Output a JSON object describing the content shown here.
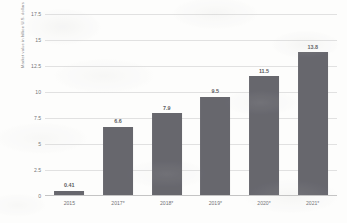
{
  "chart_data": {
    "type": "bar",
    "title": "",
    "xlabel": "",
    "ylabel": "Market value in billion U.S. dollars",
    "categories": [
      "2015",
      "2017*",
      "2018*",
      "2019*",
      "2020*",
      "2021*"
    ],
    "values": [
      0.41,
      6.6,
      7.9,
      9.5,
      11.5,
      13.8
    ],
    "value_labels": [
      "0.41",
      "6.6",
      "7.9",
      "9.5",
      "11.5",
      "13.8"
    ],
    "ylim": [
      0,
      17.5
    ],
    "y_ticks": [
      0,
      2.5,
      5,
      7.5,
      10,
      12.5,
      15,
      17.5
    ],
    "y_tick_labels": [
      "0",
      "2.5",
      "5",
      "7.5",
      "10",
      "12.5",
      "15",
      "17.5"
    ],
    "grid": true,
    "legend": false,
    "bar_color": "#4a4a52",
    "gridline_color": "#dcdcdc",
    "background_color": "#fdfdfc"
  }
}
